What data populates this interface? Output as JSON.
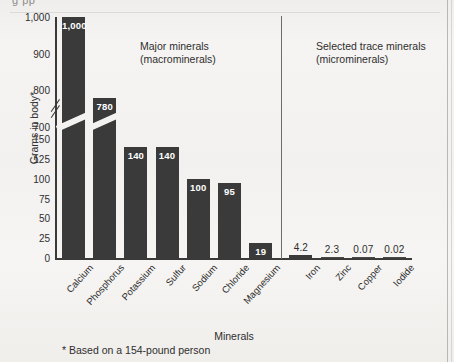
{
  "page": {
    "top_cut_text": "g                     pp",
    "footnote": "* Based on a 154-pound person"
  },
  "chart_data": {
    "type": "bar",
    "title": "",
    "xlabel": "Minerals",
    "ylabel": "Grams in body*",
    "categories": [
      "Calcium",
      "Phosphorus",
      "Potassium",
      "Sulfur",
      "Sodium",
      "Chloride",
      "Magnesium",
      "Iron",
      "Zinc",
      "Copper",
      "Iodide"
    ],
    "values": [
      1000,
      780,
      140,
      140,
      100,
      95,
      19,
      4.2,
      2.3,
      0.07,
      0.02
    ],
    "value_labels": [
      "1,000",
      "780",
      "140",
      "140",
      "100",
      "95",
      "19",
      "4.2",
      "2.3",
      "0.07",
      "0.02"
    ],
    "label_inside": [
      true,
      true,
      true,
      true,
      true,
      true,
      true,
      false,
      false,
      false,
      false
    ],
    "yticks": [
      "1,000",
      "900",
      "800",
      "700",
      "150",
      "125",
      "100",
      "75",
      "50",
      "25",
      "0"
    ],
    "ytick_values": [
      1000,
      900,
      800,
      700,
      150,
      125,
      100,
      75,
      50,
      25,
      0
    ],
    "ylim": [
      0,
      1000
    ],
    "axis_break": {
      "present": true,
      "between": [
        150,
        700
      ]
    },
    "grid": false,
    "bar_color": "#3a3a3a",
    "legend_position": "none",
    "groups": [
      {
        "name": "Major minerals (macrominerals)",
        "categories": [
          "Calcium",
          "Phosphorus",
          "Potassium",
          "Sulfur",
          "Sodium",
          "Chloride",
          "Magnesium"
        ]
      },
      {
        "name": "Selected trace minerals (microminerals)",
        "categories": [
          "Iron",
          "Zinc",
          "Copper",
          "Iodide"
        ]
      }
    ],
    "annotations": [
      {
        "name": "major-minerals",
        "line1": "Major minerals",
        "line2": "(macrominerals)"
      },
      {
        "name": "trace-minerals",
        "line1": "Selected trace minerals",
        "line2": "(microminerals)"
      }
    ],
    "divider_after_category": "Magnesium"
  }
}
